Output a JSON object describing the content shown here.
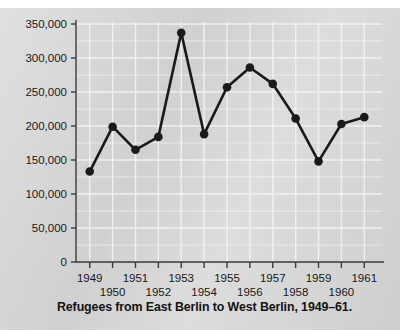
{
  "caption": "Refugees from East Berlin to West Berlin, 1949–61.",
  "axis": {
    "y_ticks": [
      "0",
      "50,000",
      "100,000",
      "150,000",
      "200,000",
      "250,000",
      "300,000",
      "350,000"
    ],
    "x_ticks": [
      "1949",
      "1950",
      "1951",
      "1952",
      "1953",
      "1954",
      "1955",
      "1956",
      "1957",
      "1958",
      "1959",
      "1960",
      "1961"
    ]
  },
  "colors": {
    "paper": "#d6d6d6",
    "gridline": "#f2f2f2",
    "axis": "#3a3a3c",
    "series": "#1a1a1c",
    "text": "#18181a"
  },
  "chart_data": {
    "type": "line",
    "title": "Refugees from East Berlin to West Berlin, 1949–61.",
    "xlabel": "",
    "ylabel": "",
    "xlim": [
      1948.4,
      1961.6
    ],
    "ylim": [
      0,
      350000
    ],
    "grid": true,
    "legend": false,
    "marker": "filled-circle",
    "categories": [
      1949,
      1950,
      1951,
      1952,
      1953,
      1954,
      1955,
      1956,
      1957,
      1958,
      1959,
      1960,
      1961
    ],
    "values": [
      133000,
      199000,
      165000,
      184000,
      337000,
      188000,
      257000,
      286000,
      262000,
      211000,
      148000,
      203000,
      213000
    ],
    "series": [
      {
        "name": "Refugees from East Berlin to West Berlin",
        "values": [
          133000,
          199000,
          165000,
          184000,
          337000,
          188000,
          257000,
          286000,
          262000,
          211000,
          148000,
          203000,
          213000
        ]
      }
    ],
    "yticks": [
      0,
      50000,
      100000,
      150000,
      200000,
      250000,
      300000,
      350000
    ],
    "ytick_labels": [
      "0",
      "50,000",
      "100,000",
      "150,000",
      "200,000",
      "250,000",
      "300,000",
      "350,000"
    ],
    "xticks": [
      1949,
      1950,
      1951,
      1952,
      1953,
      1954,
      1955,
      1956,
      1957,
      1958,
      1959,
      1960,
      1961
    ],
    "xtick_labels": [
      "1949",
      "1950",
      "1951",
      "1952",
      "1953",
      "1954",
      "1955",
      "1956",
      "1957",
      "1958",
      "1959",
      "1960",
      "1961"
    ],
    "xtick_label_rows": [
      0,
      1,
      0,
      1,
      0,
      1,
      0,
      1,
      0,
      1,
      0,
      1,
      0
    ]
  }
}
